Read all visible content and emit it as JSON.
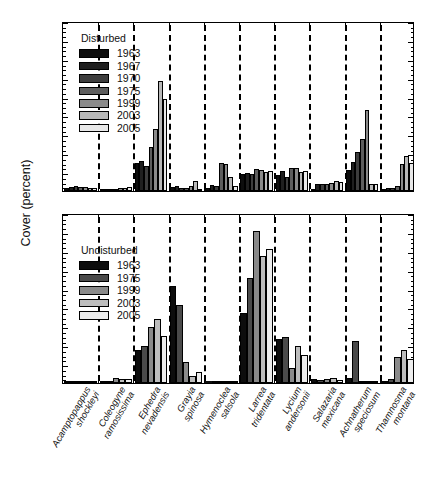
{
  "chart_data": {
    "type": "bar",
    "title": "",
    "xlabel": "",
    "ylabel": "Cover (percent)",
    "ylim": [
      0,
      18
    ],
    "ytick_step": 2,
    "yticks": [
      0,
      2,
      4,
      6,
      8,
      10,
      12,
      14,
      16,
      18
    ],
    "ytick_labels": [
      "0",
      "2",
      "4",
      "6",
      "8",
      "10",
      "12",
      "14",
      "16",
      "18"
    ],
    "grid": false,
    "group_separator": "dashed-vertical",
    "legend_position": "upper-left",
    "categories": [
      "Acamptopappus shockleyi",
      "Coleogyne ramosissima",
      "Ephedra nevadensis",
      "Grayia spinosa",
      "Hymenoclea salsola",
      "Larrea tridentata",
      "Lycium andersonii",
      "Salazaria mexicana",
      "Achnatherum speciosum",
      "Thamnosma montana"
    ],
    "category_lines": [
      [
        "Acamptopappus",
        "shockleyi"
      ],
      [
        "Coleogyne",
        "ramosissima"
      ],
      [
        "Ephedra",
        "nevadensis"
      ],
      [
        "Grayia",
        "spinosa"
      ],
      [
        "Hymenoclea",
        "salsola"
      ],
      [
        "Larrea",
        "tridentata"
      ],
      [
        "Lycium",
        "andersonii"
      ],
      [
        "Salazaria",
        "mexicana"
      ],
      [
        "Achnatherum",
        "speciosum"
      ],
      [
        "Thamnosma",
        "montana"
      ]
    ],
    "panels": [
      {
        "name": "Disturbed",
        "legend_title": "Disturbed",
        "series": [
          {
            "name": "1963",
            "color": "#0d0d0d",
            "values": [
              0.3,
              0.15,
              3.0,
              0.45,
              0.35,
              1.8,
              1.65,
              0.25,
              2.2,
              0.2
            ]
          },
          {
            "name": "1967",
            "color": "#1f1f1f",
            "values": [
              0.45,
              0.18,
              3.2,
              0.55,
              0.6,
              1.95,
              2.1,
              0.7,
              3.1,
              0.3
            ]
          },
          {
            "name": "1970",
            "color": "#3d3d3d",
            "values": [
              0.5,
              0.2,
              2.6,
              0.35,
              0.55,
              1.75,
              1.5,
              0.75,
              4.1,
              0.35
            ]
          },
          {
            "name": "1975",
            "color": "#5e5e5e",
            "values": [
              0.42,
              0.22,
              4.7,
              0.3,
              2.95,
              2.35,
              2.4,
              0.75,
              5.55,
              0.55
            ]
          },
          {
            "name": "1999",
            "color": "#8a8a8a",
            "values": [
              0.4,
              0.28,
              6.6,
              0.5,
              2.85,
              2.25,
              2.45,
              0.8,
              8.55,
              2.85
            ]
          },
          {
            "name": "2003",
            "color": "#b8b8b8",
            "values": [
              0.35,
              0.35,
              11.7,
              1.05,
              1.45,
              2.05,
              2.05,
              1.05,
              0.7,
              3.75
            ]
          },
          {
            "name": "2005",
            "color": "#e8e8e8",
            "values": [
              0.3,
              0.4,
              9.7,
              0.25,
              0.55,
              2.1,
              2.1,
              0.95,
              0.7,
              2.95
            ]
          }
        ]
      },
      {
        "name": "Undisturbed",
        "legend_title": "Undisturbed",
        "series": [
          {
            "name": "1963",
            "color": "#0d0d0d",
            "values": [
              0.15,
              0.2,
              3.45,
              10.3,
              0.0,
              7.4,
              4.7,
              0.4,
              0.55,
              0.2
            ]
          },
          {
            "name": "1975",
            "color": "#4a4a4a",
            "values": [
              0.1,
              0.25,
              3.95,
              8.25,
              0.05,
              11.1,
              4.85,
              0.3,
              4.45,
              0.45
            ]
          },
          {
            "name": "1999",
            "color": "#8a8a8a",
            "values": [
              0.05,
              0.5,
              5.9,
              2.25,
              0.05,
              16.1,
              1.55,
              0.4,
              0.1,
              2.8
            ]
          },
          {
            "name": "2003",
            "color": "#bdbdbd",
            "values": [
              0.05,
              0.45,
              6.75,
              0.75,
              0.1,
              13.4,
              3.9,
              0.55,
              0.12,
              3.45
            ]
          },
          {
            "name": "2005",
            "color": "#ededed",
            "values": [
              0.05,
              0.4,
              4.95,
              1.15,
              0.1,
              14.2,
              2.95,
              0.35,
              0.1,
              2.55
            ]
          }
        ]
      }
    ]
  }
}
